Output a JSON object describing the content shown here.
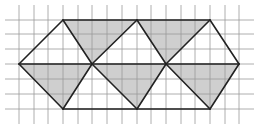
{
  "diagram": {
    "type": "geometric-tessellation",
    "width": 259,
    "height": 128,
    "grid": {
      "x_lines": [
        19,
        34,
        48,
        63,
        78,
        92,
        107,
        122,
        137,
        151,
        166,
        181,
        195,
        210,
        225,
        239
      ],
      "y_lines": [
        20,
        34,
        49,
        64,
        79,
        94,
        109
      ],
      "x_extent": [
        5,
        254
      ],
      "y_extent": [
        5,
        124
      ],
      "color": "#9a9a9a"
    },
    "vertices": {
      "top": [
        [
          63,
          20
        ],
        [
          137,
          20
        ],
        [
          210,
          20
        ]
      ],
      "middle": [
        [
          19,
          64
        ],
        [
          92,
          64
        ],
        [
          166,
          64
        ],
        [
          239,
          64
        ]
      ],
      "bottom": [
        [
          63,
          109
        ],
        [
          137,
          109
        ],
        [
          210,
          109
        ]
      ]
    },
    "shaded_triangles": [
      [
        [
          63,
          20
        ],
        [
          137,
          20
        ],
        [
          92,
          64
        ]
      ],
      [
        [
          137,
          20
        ],
        [
          210,
          20
        ],
        [
          166,
          64
        ]
      ],
      [
        [
          19,
          64
        ],
        [
          92,
          64
        ],
        [
          63,
          109
        ]
      ],
      [
        [
          92,
          64
        ],
        [
          166,
          64
        ],
        [
          137,
          109
        ]
      ],
      [
        [
          166,
          64
        ],
        [
          239,
          64
        ],
        [
          210,
          109
        ]
      ]
    ],
    "outline_segments": [
      [
        [
          63,
          20
        ],
        [
          210,
          20
        ]
      ],
      [
        [
          63,
          109
        ],
        [
          210,
          109
        ]
      ],
      [
        [
          19,
          64
        ],
        [
          239,
          64
        ]
      ],
      [
        [
          19,
          64
        ],
        [
          63,
          20
        ]
      ],
      [
        [
          63,
          20
        ],
        [
          92,
          64
        ]
      ],
      [
        [
          92,
          64
        ],
        [
          137,
          20
        ]
      ],
      [
        [
          137,
          20
        ],
        [
          166,
          64
        ]
      ],
      [
        [
          166,
          64
        ],
        [
          210,
          20
        ]
      ],
      [
        [
          210,
          20
        ],
        [
          239,
          64
        ]
      ],
      [
        [
          19,
          64
        ],
        [
          63,
          109
        ]
      ],
      [
        [
          63,
          109
        ],
        [
          92,
          64
        ]
      ],
      [
        [
          92,
          64
        ],
        [
          137,
          109
        ]
      ],
      [
        [
          137,
          109
        ],
        [
          166,
          64
        ]
      ],
      [
        [
          166,
          64
        ],
        [
          210,
          109
        ]
      ],
      [
        [
          210,
          109
        ],
        [
          239,
          64
        ]
      ]
    ],
    "colors": {
      "shade": "#cfcfcf",
      "outline": "#222222",
      "background": "#ffffff"
    }
  }
}
